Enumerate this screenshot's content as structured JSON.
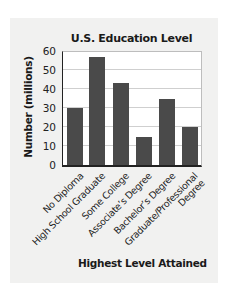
{
  "chart_data": {
    "type": "bar",
    "title": "U.S. Education Level",
    "xlabel": "Highest Level Attained",
    "ylabel": "Number (millions)",
    "categories": [
      "No Diploma",
      "High School Graduate",
      "Some College",
      "Associate's Degree",
      "Bachelor's Degree",
      "Graduate/Professional Degree"
    ],
    "category_labels": [
      [
        "No Diploma"
      ],
      [
        "High School Graduate"
      ],
      [
        "Some College"
      ],
      [
        "Associate’s Degree"
      ],
      [
        "Bachelor’s Degree"
      ],
      [
        "Graduate/Professional",
        "Degree"
      ]
    ],
    "values": [
      30,
      57,
      43,
      15,
      35,
      20
    ],
    "ylim": [
      0,
      60
    ],
    "yticks": [
      "60",
      "50",
      "40",
      "30",
      "20",
      "10",
      "0"
    ],
    "grid": true,
    "legend": null,
    "colors": {
      "bar": "#4a4a4a",
      "panel": "#f1f1f0",
      "plot_bg": "#ffffff",
      "grid": "#cfcfcf"
    }
  }
}
